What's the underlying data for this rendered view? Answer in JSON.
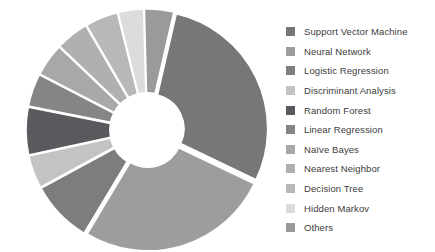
{
  "chart_data": {
    "type": "pie",
    "variant": "exploded-donut",
    "title": "",
    "subtitle": "",
    "xlabel": "",
    "ylabel": "",
    "legend_position": "right",
    "grid": false,
    "hole_ratio": 0.29,
    "start_angle_deg": -77,
    "direction": "clockwise",
    "categories": [
      "Support Vector Machine",
      "Neural Network",
      "Logistic Regression",
      "Discriminant Analysis",
      "Random Forest",
      "Linear Regression",
      "Naïve Bayes",
      "Nearest Neighbor",
      "Decision Tree",
      "Hidden Markov",
      "Others"
    ],
    "values": [
      28.5,
      26.5,
      8.5,
      4.5,
      6.5,
      4.5,
      4.5,
      4.5,
      4.5,
      3.5,
      4.0
    ],
    "colors": [
      "#77777a",
      "#9d9d9f",
      "#7d7d80",
      "#c3c3c5",
      "#595a5d",
      "#858588",
      "#a8a8ab",
      "#b0b0b2",
      "#b8b8ba",
      "#dcdcde",
      "#9a9a9d"
    ],
    "slices": [
      {
        "label": "Support Vector Machine",
        "value": 28.5,
        "color": "#77777a"
      },
      {
        "label": "Neural Network",
        "value": 26.5,
        "color": "#9d9d9f"
      },
      {
        "label": "Logistic Regression",
        "value": 8.5,
        "color": "#7d7d80"
      },
      {
        "label": "Discriminant Analysis",
        "value": 4.5,
        "color": "#c3c3c5"
      },
      {
        "label": "Random Forest",
        "value": 6.5,
        "color": "#595a5d"
      },
      {
        "label": "Linear Regression",
        "value": 4.5,
        "color": "#858588"
      },
      {
        "label": "Naïve Bayes",
        "value": 4.5,
        "color": "#a8a8ab"
      },
      {
        "label": "Nearest Neighbor",
        "value": 4.5,
        "color": "#b0b0b2"
      },
      {
        "label": "Decision Tree",
        "value": 4.5,
        "color": "#b8b8ba"
      },
      {
        "label": "Hidden Markov",
        "value": 3.5,
        "color": "#dcdcde"
      },
      {
        "label": "Others",
        "value": 4.0,
        "color": "#9a9a9d"
      }
    ]
  },
  "legend": {
    "items": [
      {
        "label": "Support Vector Machine",
        "color": "#77777a"
      },
      {
        "label": "Neural Network",
        "color": "#9d9d9f"
      },
      {
        "label": "Logistic Regression",
        "color": "#7d7d80"
      },
      {
        "label": "Discriminant Analysis",
        "color": "#c3c3c5"
      },
      {
        "label": "Random Forest",
        "color": "#595a5d"
      },
      {
        "label": "Linear Regression",
        "color": "#858588"
      },
      {
        "label": "Naïve Bayes",
        "color": "#a8a8ab"
      },
      {
        "label": "Nearest Neighbor",
        "color": "#b0b0b2"
      },
      {
        "label": "Decision Tree",
        "color": "#b8b8ba"
      },
      {
        "label": "Hidden Markov",
        "color": "#dcdcde"
      },
      {
        "label": "Others",
        "color": "#9a9a9d"
      }
    ]
  },
  "canvas": {
    "background": "#ffffff",
    "hole_color": "#ffffff"
  }
}
